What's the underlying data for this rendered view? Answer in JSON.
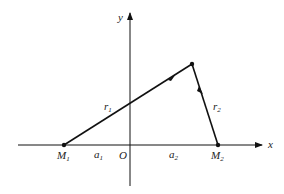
{
  "diagram": {
    "axes": {
      "x_label": "x",
      "y_label": "y",
      "origin_label": "O"
    },
    "points": [
      {
        "id": "M1",
        "label": "M",
        "sub": "1"
      },
      {
        "id": "M2",
        "label": "M",
        "sub": "2"
      },
      {
        "id": "P",
        "label": ""
      }
    ],
    "segments": [
      {
        "from": "M1",
        "to": "P",
        "label": "r",
        "sub": "1"
      },
      {
        "from": "P",
        "to": "M2",
        "label": "r",
        "sub": "2"
      }
    ],
    "distances": [
      {
        "label": "a",
        "sub": "1"
      },
      {
        "label": "a",
        "sub": "2"
      }
    ],
    "line_color": "#111111"
  }
}
